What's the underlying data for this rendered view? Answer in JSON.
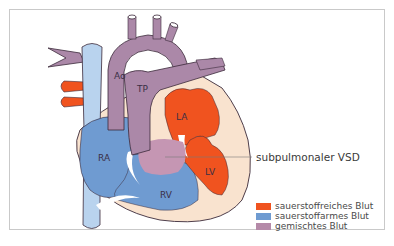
{
  "diagram": {
    "type": "anatomical-heart-schematic",
    "labels": {
      "aorta": "Ao",
      "pulmonary_trunk": "TP",
      "left_atrium": "LA",
      "right_atrium": "RA",
      "right_ventricle": "RV",
      "left_ventricle": "LV"
    },
    "callout": "subpulmonaler VSD",
    "legend": [
      {
        "label": "sauerstoffreiches Blut",
        "color": "#f0531f"
      },
      {
        "label": "sauerstoffarmes Blut",
        "color": "#6f9bd1"
      },
      {
        "label": "gemischtes Blut",
        "color": "#b58aa8"
      }
    ],
    "colors": {
      "oxygenated": "#f0531f",
      "deoxygenated": "#6f9bd1",
      "mixed": "#b58aa8",
      "vessel_purple": "#ab88a8",
      "vena_cava": "#b9d3ee",
      "myocardium": "#f9e3cf",
      "outline": "#3b2a3a"
    }
  }
}
